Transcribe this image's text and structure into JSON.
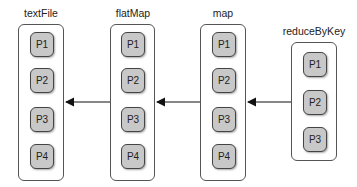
{
  "diagram": {
    "stages": [
      {
        "id": "textFile",
        "label": "textFile",
        "partitions": [
          "P1",
          "P2",
          "P3",
          "P4"
        ]
      },
      {
        "id": "flatMap",
        "label": "flatMap",
        "partitions": [
          "P1",
          "P2",
          "P3",
          "P4"
        ]
      },
      {
        "id": "map",
        "label": "map",
        "partitions": [
          "P1",
          "P2",
          "P3",
          "P4"
        ]
      },
      {
        "id": "reduceByKey",
        "label": "reduceByKey",
        "partitions": [
          "P1",
          "P2",
          "P3"
        ]
      }
    ],
    "edges": [
      {
        "from": "flatMap",
        "to": "textFile"
      },
      {
        "from": "map",
        "to": "flatMap"
      },
      {
        "from": "reduceByKey",
        "to": "map"
      }
    ],
    "colors": {
      "partition_fill": "#c8c8c8",
      "border": "#444444",
      "arrow": "#111111"
    }
  }
}
